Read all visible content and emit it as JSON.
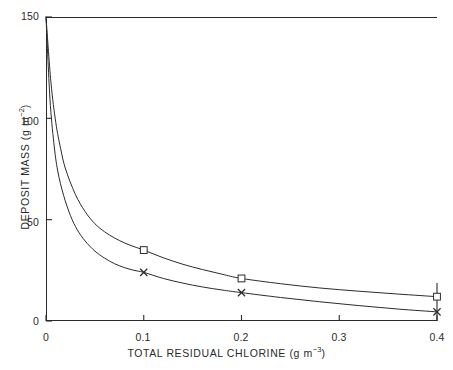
{
  "chart_data": {
    "type": "line",
    "title": "",
    "xlabel": "TOTAL RESIDUAL CHLORINE (g m−3)",
    "ylabel": "DEPOSIT MASS (g m−2)",
    "xlabel_text": "TOTAL RESIDUAL CHLORINE",
    "xlabel_unit_base": "(g m",
    "xlabel_unit_exp": "−3",
    "xlabel_unit_close": ")",
    "ylabel_text": "DEPOSIT MASS",
    "ylabel_unit_base": "(g m",
    "ylabel_unit_exp": "−2",
    "ylabel_unit_close": ")",
    "xlim": [
      0,
      0.4
    ],
    "ylim": [
      0,
      150
    ],
    "xticks": [
      0,
      0.1,
      0.2,
      0.3,
      0.4
    ],
    "xticklabels": [
      "0",
      "0.1",
      "0.2",
      "0.3",
      "0.4"
    ],
    "yticks": [
      0,
      50,
      100,
      150
    ],
    "yticklabels": [
      "0",
      "50",
      "100",
      "150"
    ],
    "grid": false,
    "legend": "none",
    "line_color": "#2b2b2b",
    "series": [
      {
        "name": "upper-curve",
        "marker": "square",
        "points": [
          {
            "x": 0.0,
            "y": 150.0
          },
          {
            "x": 0.005,
            "y": 118.0
          },
          {
            "x": 0.01,
            "y": 98.0
          },
          {
            "x": 0.015,
            "y": 85.0
          },
          {
            "x": 0.02,
            "y": 75.0
          },
          {
            "x": 0.03,
            "y": 62.5
          },
          {
            "x": 0.04,
            "y": 54.0
          },
          {
            "x": 0.05,
            "y": 48.0
          },
          {
            "x": 0.06,
            "y": 44.0
          },
          {
            "x": 0.07,
            "y": 41.0
          },
          {
            "x": 0.08,
            "y": 38.6
          },
          {
            "x": 0.09,
            "y": 36.7
          },
          {
            "x": 0.1,
            "y": 35.0
          },
          {
            "x": 0.12,
            "y": 31.2
          },
          {
            "x": 0.14,
            "y": 28.0
          },
          {
            "x": 0.16,
            "y": 25.4
          },
          {
            "x": 0.18,
            "y": 23.1
          },
          {
            "x": 0.2,
            "y": 21.0
          },
          {
            "x": 0.24,
            "y": 18.4
          },
          {
            "x": 0.28,
            "y": 16.3
          },
          {
            "x": 0.32,
            "y": 14.7
          },
          {
            "x": 0.36,
            "y": 13.3
          },
          {
            "x": 0.4,
            "y": 12.0
          }
        ],
        "markers": [
          {
            "x": 0.1,
            "y": 35.0
          },
          {
            "x": 0.2,
            "y": 21.0
          },
          {
            "x": 0.4,
            "y": 12.0
          }
        ]
      },
      {
        "name": "lower-curve",
        "marker": "cross",
        "points": [
          {
            "x": 0.0,
            "y": 150.0
          },
          {
            "x": 0.004,
            "y": 110.0
          },
          {
            "x": 0.008,
            "y": 88.0
          },
          {
            "x": 0.012,
            "y": 74.0
          },
          {
            "x": 0.018,
            "y": 62.0
          },
          {
            "x": 0.025,
            "y": 52.0
          },
          {
            "x": 0.032,
            "y": 45.0
          },
          {
            "x": 0.04,
            "y": 39.5
          },
          {
            "x": 0.05,
            "y": 34.5
          },
          {
            "x": 0.06,
            "y": 31.0
          },
          {
            "x": 0.07,
            "y": 28.3
          },
          {
            "x": 0.08,
            "y": 26.4
          },
          {
            "x": 0.09,
            "y": 25.0
          },
          {
            "x": 0.1,
            "y": 24.0
          },
          {
            "x": 0.12,
            "y": 21.0
          },
          {
            "x": 0.14,
            "y": 18.7
          },
          {
            "x": 0.16,
            "y": 16.8
          },
          {
            "x": 0.18,
            "y": 15.3
          },
          {
            "x": 0.2,
            "y": 14.0
          },
          {
            "x": 0.24,
            "y": 11.6
          },
          {
            "x": 0.28,
            "y": 9.5
          },
          {
            "x": 0.32,
            "y": 7.6
          },
          {
            "x": 0.36,
            "y": 5.9
          },
          {
            "x": 0.4,
            "y": 4.5
          }
        ],
        "markers": [
          {
            "x": 0.1,
            "y": 24.0
          },
          {
            "x": 0.2,
            "y": 14.0
          },
          {
            "x": 0.4,
            "y": 4.5
          }
        ]
      }
    ]
  }
}
